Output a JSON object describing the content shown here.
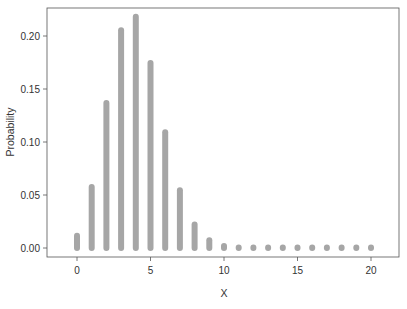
{
  "chart_data": {
    "type": "bar",
    "title": "",
    "xlabel": "X",
    "ylabel": "Probability",
    "x": [
      0,
      1,
      2,
      3,
      4,
      5,
      6,
      7,
      8,
      9,
      10,
      11,
      12,
      13,
      14,
      15,
      16,
      17,
      18,
      19,
      20
    ],
    "values": [
      0.0115,
      0.0576,
      0.1369,
      0.2054,
      0.2182,
      0.1746,
      0.1091,
      0.0545,
      0.0222,
      0.0074,
      0.002,
      0.0005,
      0.0001,
      0.0,
      0.0,
      0.0,
      0.0,
      0.0,
      0.0,
      0.0,
      0.0
    ],
    "xlim": [
      -2,
      22
    ],
    "ylim": [
      -0.01,
      0.225
    ],
    "x_ticks": [
      0,
      5,
      10,
      15,
      20
    ],
    "x_tick_labels": [
      "0",
      "5",
      "10",
      "15",
      "20"
    ],
    "y_ticks": [
      0.0,
      0.05,
      0.1,
      0.15,
      0.2
    ],
    "y_tick_labels": [
      "0.00",
      "0.05",
      "0.10",
      "0.15",
      "0.20"
    ],
    "grid": false,
    "legend": null,
    "bar_color": "#a6a6a6"
  }
}
